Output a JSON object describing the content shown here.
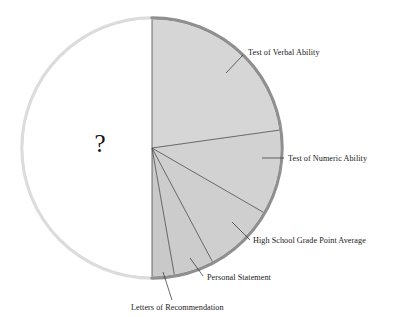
{
  "figure": {
    "name": "admission-criteria-pie-chart",
    "center_marker": "?"
  },
  "chart_data": {
    "type": "pie",
    "title": "",
    "subtitle": "",
    "xlabel": "",
    "ylabel": "",
    "grid": false,
    "legend_position": "callout-labels-right",
    "start_angle_deg": -90,
    "direction": "clockwise",
    "center_px": [
      152,
      148
    ],
    "radius_px": 130,
    "unknown_slice": {
      "label": "?",
      "value": 50,
      "shaded": false,
      "note": "Unlabeled remaining half of the circle marked with a question mark"
    },
    "categories": [
      "Test of Verbal Ability",
      "Test of Numeric Ability",
      "High School Grade Point Average",
      "Personal Statement",
      "Letters of Recommendation",
      "?"
    ],
    "values": [
      22.8,
      10.6,
      8.9,
      5.0,
      2.8,
      50.0
    ],
    "slices": [
      {
        "label": "Test of Verbal Ability",
        "value": 22.8,
        "start_deg": -90,
        "end_deg": -8,
        "fill": "#d6d6d6",
        "shaded": true,
        "leader": {
          "x1": 226,
          "y1": 73,
          "x2": 243,
          "y2": 55
        },
        "text_x": 248,
        "text_y": 55,
        "anchor": "start"
      },
      {
        "label": "Test of Numeric Ability",
        "value": 10.6,
        "start_deg": -8,
        "end_deg": 30,
        "fill": "#d2d2d2",
        "shaded": true,
        "leader": {
          "x1": 262,
          "y1": 158,
          "x2": 284,
          "y2": 158
        },
        "text_x": 288,
        "text_y": 161,
        "anchor": "start"
      },
      {
        "label": "High School Grade Point Average",
        "value": 8.9,
        "start_deg": 30,
        "end_deg": 62,
        "fill": "#cfcfcf",
        "shaded": true,
        "leader": {
          "x1": 232,
          "y1": 222,
          "x2": 250,
          "y2": 240
        },
        "text_x": 253,
        "text_y": 243,
        "anchor": "start"
      },
      {
        "label": "Personal Statement",
        "value": 5.0,
        "start_deg": 62,
        "end_deg": 80,
        "fill": "#cccccc",
        "shaded": true,
        "leader": {
          "x1": 190,
          "y1": 258,
          "x2": 203,
          "y2": 276
        },
        "text_x": 207,
        "text_y": 280,
        "anchor": "start"
      },
      {
        "label": "Letters of Recommendation",
        "value": 2.8,
        "start_deg": 80,
        "end_deg": 90,
        "fill": "#c9c9c9",
        "shaded": true,
        "leader": {
          "x1": 163,
          "y1": 272,
          "x2": 172,
          "y2": 300
        },
        "text_x": 131,
        "text_y": 310,
        "anchor": "start"
      }
    ],
    "colors": {
      "slice_fill_light": "#d6d6d6",
      "slice_fill_dark": "#c9c9c9",
      "unknown_fill": "#ffffff",
      "rim_dark": "#8d8d8d",
      "rim_light": "#d9d9d9",
      "divider_line": "#4a4a4a",
      "text": "#1a1a1a"
    }
  }
}
